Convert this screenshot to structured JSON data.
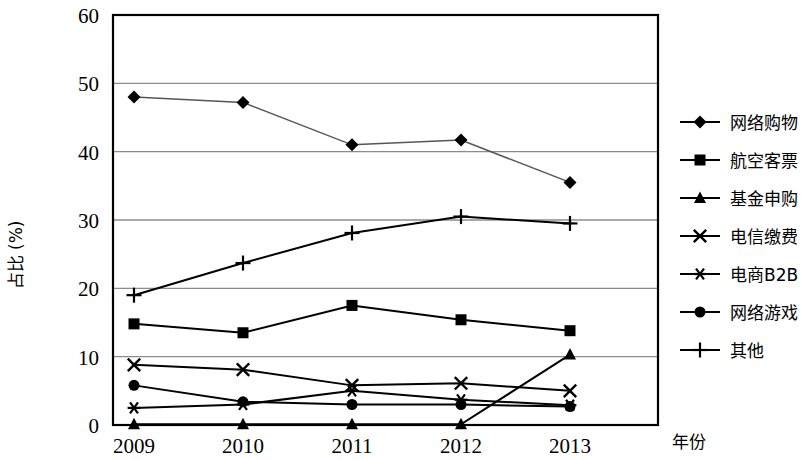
{
  "chart_data": {
    "type": "line",
    "title": "",
    "xlabel": "年份",
    "ylabel": "占比 (%)",
    "x": [
      "2009",
      "2010",
      "2011",
      "2012",
      "2013"
    ],
    "categories": [
      "2009",
      "2010",
      "2011",
      "2012",
      "2013"
    ],
    "xlim": [
      2008.6,
      2013.5
    ],
    "ylim": [
      0,
      60
    ],
    "yticks": [
      "0",
      "10",
      "20",
      "30",
      "40",
      "50",
      "60"
    ],
    "ytick_values": [
      0,
      10,
      20,
      30,
      40,
      50,
      60
    ],
    "grid": "horizontal",
    "legend_position": "right",
    "series": [
      {
        "name": "网络购物",
        "marker": "diamond",
        "color": "#000000",
        "values": [
          48.0,
          47.2,
          41.0,
          41.7,
          35.5
        ]
      },
      {
        "name": "航空客票",
        "marker": "square",
        "color": "#000000",
        "values": [
          14.8,
          13.5,
          17.5,
          15.4,
          13.8
        ]
      },
      {
        "name": "基金申购",
        "marker": "triangle",
        "color": "#000000",
        "values": [
          0.1,
          0.1,
          0.1,
          0.1,
          10.3
        ]
      },
      {
        "name": "电信缴费",
        "marker": "cross",
        "color": "#000000",
        "values": [
          8.8,
          8.1,
          5.8,
          6.1,
          5.0
        ]
      },
      {
        "name": "电商B2B",
        "marker": "asterisk",
        "color": "#000000",
        "values": [
          2.5,
          3.0,
          5.0,
          3.7,
          2.9
        ]
      },
      {
        "name": "网络游戏",
        "marker": "circle",
        "color": "#000000",
        "values": [
          5.8,
          3.4,
          3.0,
          3.0,
          2.7
        ]
      },
      {
        "name": "其他",
        "marker": "plus",
        "color": "#000000",
        "values": [
          19.0,
          23.7,
          28.1,
          30.5,
          29.5
        ]
      }
    ]
  },
  "axes": {
    "y_title": "占比 (%)",
    "x_title": "年份",
    "y_ticks": [
      "60",
      "50",
      "40",
      "30",
      "20",
      "10",
      "0"
    ],
    "x_ticks": [
      "2009",
      "2010",
      "2011",
      "2012",
      "2013"
    ]
  },
  "legend": {
    "items": [
      {
        "label": "网络购物",
        "marker": "diamond"
      },
      {
        "label": "航空客票",
        "marker": "square"
      },
      {
        "label": "基金申购",
        "marker": "triangle"
      },
      {
        "label": "电信缴费",
        "marker": "cross"
      },
      {
        "label": "电商B2B",
        "marker": "asterisk"
      },
      {
        "label": "网络游戏",
        "marker": "circle"
      },
      {
        "label": "其他",
        "marker": "plus"
      }
    ]
  },
  "style": {
    "frame_color": "#000000",
    "grid_color": "#8c8c8c",
    "series_color": "#000000",
    "background": "#ffffff"
  }
}
